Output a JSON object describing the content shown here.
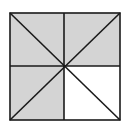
{
  "diagram": {
    "shaded_color": "#d4d4d4",
    "unshaded_color": "#ffffff",
    "line_color": "#1a1a1a",
    "total_parts": 8,
    "shaded_parts": 6
  }
}
